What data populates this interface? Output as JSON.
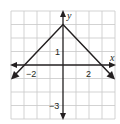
{
  "figure": {
    "type": "coordinate-graph",
    "function_description": "absolute value function, vertex (0, 3), opening downward",
    "x_axis_label": "x",
    "y_axis_label": "y",
    "x_range": [
      -4,
      4
    ],
    "y_range": [
      -4,
      4
    ],
    "grid": true,
    "tick_labels": {
      "x_neg": "−2",
      "x_pos": "2",
      "y_pos": "1",
      "y_neg": "−3"
    },
    "vertex": [
      0,
      3
    ],
    "left_ray_end": [
      -3.8,
      -0.8
    ],
    "right_ray_end": [
      3.8,
      -0.8
    ],
    "colors": {
      "grid": "#c8c8c8",
      "axis": "#231f20",
      "curve": "#231f20",
      "background": "#ffffff"
    }
  }
}
